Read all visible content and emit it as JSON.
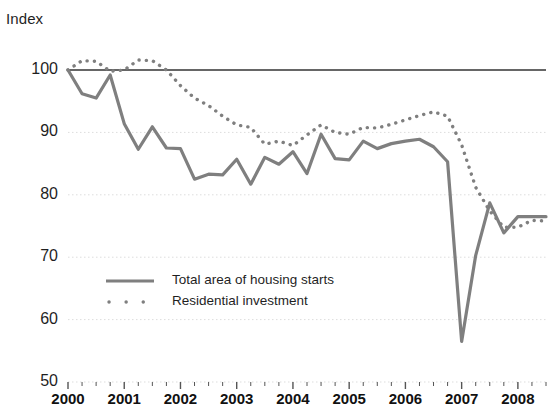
{
  "chart_data": {
    "type": "line",
    "title": "",
    "ylabel": "Index",
    "xlabel": "",
    "ylim": [
      50,
      100
    ],
    "yticks": [
      50,
      60,
      70,
      80,
      90,
      100
    ],
    "xticks": [
      "2000",
      "2001",
      "2002",
      "2003",
      "2004",
      "2005",
      "2006",
      "2007",
      "2008"
    ],
    "x_minor_tick_interval": "quarterly",
    "grid": "horizontal dotted gridlines at 60, 70, 80, 90; solid reference line at 100",
    "legend_position": "inside lower-left",
    "reference_line": 100,
    "x": [
      "2000Q1",
      "2000Q2",
      "2000Q3",
      "2000Q4",
      "2001Q1",
      "2001Q2",
      "2001Q3",
      "2001Q4",
      "2002Q1",
      "2002Q2",
      "2002Q3",
      "2002Q4",
      "2003Q1",
      "2003Q2",
      "2003Q3",
      "2003Q4",
      "2004Q1",
      "2004Q2",
      "2004Q3",
      "2004Q4",
      "2005Q1",
      "2005Q2",
      "2005Q3",
      "2005Q4",
      "2006Q1",
      "2006Q2",
      "2006Q3",
      "2006Q4",
      "2007Q1",
      "2007Q2",
      "2007Q3",
      "2007Q4",
      "2008Q1",
      "2008Q2",
      "2008Q3"
    ],
    "series": [
      {
        "name": "Total area of housing starts",
        "style": "solid",
        "color": "#7f7f7f",
        "values": [
          100.0,
          96.2,
          95.5,
          99.2,
          91.4,
          87.3,
          90.9,
          87.5,
          87.4,
          82.5,
          83.3,
          83.2,
          85.7,
          81.7,
          86.0,
          84.9,
          86.9,
          83.4,
          89.7,
          85.8,
          85.6,
          88.6,
          87.4,
          88.2,
          88.6,
          88.9,
          87.7,
          85.3,
          56.5,
          70.3,
          78.7,
          73.9,
          76.5,
          76.5,
          76.5
        ]
      },
      {
        "name": "Residential investment",
        "style": "dotted",
        "color": "#7f7f7f",
        "values": [
          100.0,
          101.5,
          101.4,
          99.8,
          100.0,
          101.6,
          101.5,
          100.0,
          97.5,
          95.5,
          94.3,
          92.6,
          91.2,
          90.8,
          88.1,
          88.6,
          87.9,
          89.6,
          91.2,
          90.0,
          89.7,
          90.8,
          90.7,
          91.3,
          92.0,
          92.7,
          93.3,
          92.6,
          88.0,
          81.2,
          77.4,
          74.8,
          74.8,
          75.9,
          75.8
        ]
      }
    ]
  },
  "legend": {
    "items": [
      {
        "label": "Total area of housing starts",
        "style": "solid"
      },
      {
        "label": "Residential investment",
        "style": "dotted"
      }
    ]
  },
  "axes": {
    "y_label": "Index",
    "y_tick_labels": [
      "100",
      "90",
      "80",
      "70",
      "60",
      "50"
    ],
    "x_tick_labels": [
      "2000",
      "2001",
      "2002",
      "2003",
      "2004",
      "2005",
      "2006",
      "2007",
      "2008"
    ]
  },
  "colors": {
    "series": "#7f7f7f",
    "reference_line": "#333333",
    "gridline": "#dddddd",
    "text": "#1f1f1f"
  }
}
